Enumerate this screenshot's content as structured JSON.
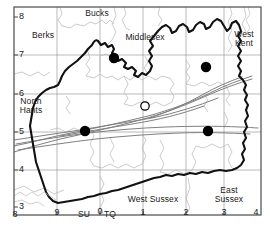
{
  "map": {
    "title": "Surrey distribution map",
    "frame": {
      "x": 14,
      "y": 7,
      "width": 247,
      "height": 208,
      "border_color": "#4a4a4a"
    },
    "grid": {
      "color": "#9b9b9b",
      "x_ticks": [
        {
          "label": "8",
          "value": 8,
          "px": 14
        },
        {
          "label": "9",
          "value": 9,
          "px": 57
        },
        {
          "label": "0",
          "value": 0,
          "px": 100
        },
        {
          "label": "1",
          "value": 1,
          "px": 143
        },
        {
          "label": "2",
          "value": 2,
          "px": 186
        },
        {
          "label": "3",
          "value": 3,
          "px": 224
        },
        {
          "label": "4",
          "value": 4,
          "px": 256
        }
      ],
      "y_ticks": [
        {
          "label": "8",
          "value": 8,
          "px": 17
        },
        {
          "label": "7",
          "value": 7,
          "px": 55
        },
        {
          "label": "6",
          "value": 6,
          "px": 94
        },
        {
          "label": "5",
          "value": 5,
          "px": 132
        },
        {
          "label": "4",
          "value": 4,
          "px": 170
        },
        {
          "label": "3",
          "value": 3,
          "px": 207
        }
      ]
    },
    "grid_square_labels": [
      {
        "name": "grid-square-su",
        "text": "SU",
        "x": 78,
        "y": 213
      },
      {
        "name": "grid-square-tq",
        "text": "TQ",
        "x": 104,
        "y": 213
      }
    ],
    "region_labels": [
      {
        "name": "region-label-bucks",
        "lines": [
          "Bucks"
        ],
        "x": 95,
        "y": 12
      },
      {
        "name": "region-label-berks",
        "lines": [
          "Berks"
        ],
        "x": 42,
        "y": 34
      },
      {
        "name": "region-label-middlesex",
        "lines": [
          "Middlesex"
        ],
        "x": 144,
        "y": 36
      },
      {
        "name": "region-label-west-kent",
        "lines": [
          "West",
          "Kent"
        ],
        "x": 243,
        "y": 34
      },
      {
        "name": "region-label-north-hants",
        "lines": [
          "North",
          "Hants"
        ],
        "x": 30,
        "y": 101
      },
      {
        "name": "region-label-west-sussex",
        "lines": [
          "West Sussex"
        ],
        "x": 152,
        "y": 199
      },
      {
        "name": "region-label-east-sussex",
        "lines": [
          "East",
          "Sussex"
        ],
        "x": 229,
        "y": 190
      }
    ],
    "markers": {
      "filled_color": "#000000",
      "open_color": "#000000",
      "filled_radius": 5.2,
      "open_radius": 4.2,
      "points": [
        {
          "name": "record-marker-1",
          "type": "filled",
          "x": 114,
          "y": 58
        },
        {
          "name": "record-marker-2",
          "type": "filled",
          "x": 206,
          "y": 67
        },
        {
          "name": "record-marker-3",
          "type": "open",
          "x": 145,
          "y": 106
        },
        {
          "name": "record-marker-4",
          "type": "filled",
          "x": 85,
          "y": 131
        },
        {
          "name": "record-marker-5",
          "type": "filled",
          "x": 208,
          "y": 131
        }
      ]
    },
    "boundaries": {
      "county_color": "#111111",
      "county_width": 2.1,
      "district_color": "#9a9a9a",
      "district_width": 0.8,
      "river_color": "#8a8a8a",
      "river_width": 0.9
    }
  }
}
